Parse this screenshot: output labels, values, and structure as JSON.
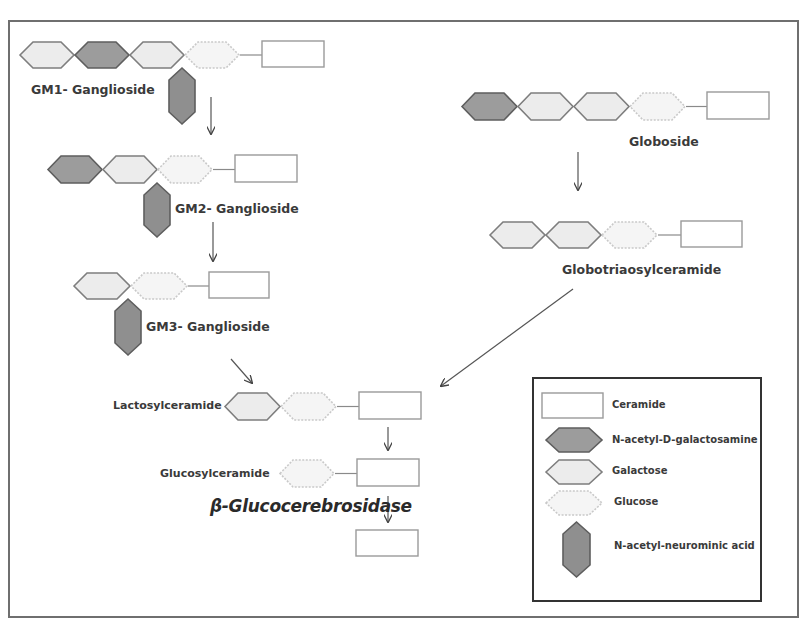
{
  "colors": {
    "frame": "#6f6f6f",
    "galnac_fill": "#9c9c9c",
    "galnac_stroke": "#5e5e5e",
    "galactose_fill": "#ececec",
    "galactose_stroke": "#7e7e7e",
    "glucose_fill": "#f5f5f5",
    "glucose_stroke": "#c9c9c9",
    "ceramide_fill": "#ffffff",
    "ceramide_stroke": "#9a9a9a",
    "nana_fill": "#8f8f8f",
    "nana_stroke": "#5e5e5e",
    "arrow": "#444444"
  },
  "molecules": {
    "gm1": {
      "label": "GM1- Ganglioside",
      "chain": [
        "galactose",
        "galnac",
        "galactose",
        "glucose",
        "ceramide"
      ],
      "branch": "nana"
    },
    "gm2": {
      "label": "GM2- Ganglioside",
      "chain": [
        "galnac",
        "galactose",
        "glucose",
        "ceramide"
      ],
      "branch": "nana"
    },
    "gm3": {
      "label": "GM3- Ganglioside",
      "chain": [
        "galactose",
        "glucose",
        "ceramide"
      ],
      "branch": "nana"
    },
    "globoside": {
      "label": "Globoside",
      "chain": [
        "galnac",
        "galactose",
        "galactose",
        "glucose",
        "ceramide"
      ]
    },
    "globotriaosylceramide": {
      "label": "Globotriaosylceramide",
      "chain": [
        "galactose",
        "galactose",
        "glucose",
        "ceramide"
      ]
    },
    "lactosylceramide": {
      "label": "Lactosylceramide",
      "chain": [
        "galactose",
        "glucose",
        "ceramide"
      ]
    },
    "glucosylceramide": {
      "label": "Glucosylceramide",
      "chain": [
        "glucose",
        "ceramide"
      ]
    },
    "ceramide": {
      "chain": [
        "ceramide"
      ]
    }
  },
  "enzyme": {
    "label": "β-Glucocerebrosidase"
  },
  "legend": {
    "items": [
      {
        "shape": "ceramide",
        "label": "Ceramide"
      },
      {
        "shape": "galnac",
        "label": "N-acetyl-D-galactosamine"
      },
      {
        "shape": "galactose",
        "label": "Galactose"
      },
      {
        "shape": "glucose",
        "label": "Glucose"
      },
      {
        "shape": "nana",
        "label": "N-acetyl-neurominic acid"
      }
    ]
  },
  "arrows": [
    {
      "from": "gm1",
      "to": "gm2"
    },
    {
      "from": "gm2",
      "to": "gm3"
    },
    {
      "from": "gm3",
      "to": "lactosylceramide"
    },
    {
      "from": "globoside",
      "to": "globotriaosylceramide"
    },
    {
      "from": "globotriaosylceramide",
      "to": "lactosylceramide"
    },
    {
      "from": "lactosylceramide",
      "to": "glucosylceramide"
    },
    {
      "from": "glucosylceramide",
      "to": "ceramide",
      "enzyme": "β-Glucocerebrosidase"
    }
  ]
}
